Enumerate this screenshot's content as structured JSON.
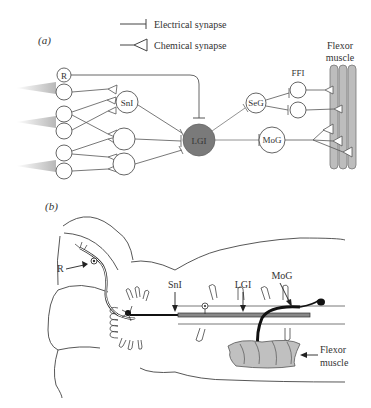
{
  "panel_a": {
    "label": "(a)",
    "legend": {
      "electrical": "Electrical synapse",
      "chemical": "Chemical synapse"
    },
    "neurons": {
      "receptor": "R",
      "sensory_interneuron": "SnI",
      "giant": "LGI",
      "segmental_giant": "SeG",
      "fast_flexor": "FFI",
      "motor_giant": "MoG"
    },
    "muscle_line1": "Flexor",
    "muscle_line2": "muscle"
  },
  "panel_b": {
    "label": "(b)",
    "labels": {
      "receptor": "R",
      "sensory_interneuron": "SnI",
      "giant": "LGI",
      "motor_giant": "MoG",
      "muscle_line1": "Flexor",
      "muscle_line2": "muscle"
    }
  },
  "colors": {
    "line": "#555555",
    "giant_fill": "#777777",
    "muscle_fill": "#bbbbbb",
    "stimulus": "#c8c8c8"
  }
}
